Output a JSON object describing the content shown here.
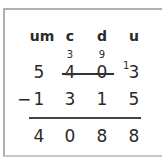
{
  "headers": [
    "um",
    "c",
    "d",
    "u"
  ],
  "borrow": {
    "c": "3",
    "d": "9",
    "u_carry": "1"
  },
  "minuend": [
    "5",
    "4",
    "0",
    "3"
  ],
  "operator": "−",
  "subtrahend": [
    "1",
    "3",
    "1",
    "5"
  ],
  "result": [
    "4",
    "0",
    "8",
    "8"
  ]
}
